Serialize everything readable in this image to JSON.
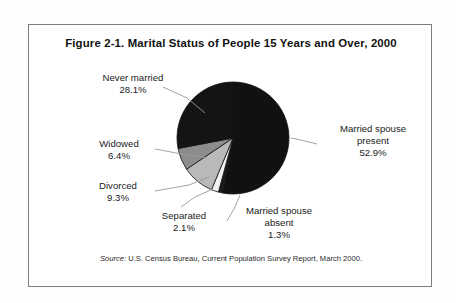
{
  "figure": {
    "title": "Figure 2-1. Marital Status of People 15 Years and Over, 2000",
    "source_prefix": "Source:",
    "source_text": " U.S. Census Bureau, Current Population Survey Report, March 2000."
  },
  "labels": {
    "never_married": {
      "name": "Never married",
      "pct": "28.1%"
    },
    "widowed": {
      "name": "Widowed",
      "pct": "6.4%"
    },
    "divorced": {
      "name": "Divorced",
      "pct": "9.3%"
    },
    "separated": {
      "name": "Separated",
      "pct": "2.1%"
    },
    "married_absent": {
      "name": "Married spouse",
      "name2": "absent",
      "pct": "1.3%"
    },
    "married_present": {
      "name": "Married spouse",
      "name2": "present",
      "pct": "52.9%"
    }
  },
  "colors": {
    "married_present": "#111111",
    "married_absent": "#1c1c1c",
    "separated": "#f2f2f2",
    "divorced": "#b9b9b9",
    "widowed": "#8c8c8c",
    "never_married": "#141414",
    "outline": "#111111",
    "frame": "#7d7d7d",
    "leader": "#9a9a9a",
    "background": "#ffffff"
  },
  "chart_data": {
    "type": "pie",
    "title": "Figure 2-1. Marital Status of People 15 Years and Over, 2000",
    "xlabel": "",
    "ylabel": "",
    "units": "percent",
    "legend_position": "callout-labels",
    "grid": false,
    "start_angle_deg": 0,
    "direction": "clockwise",
    "categories": [
      "Married spouse present",
      "Married spouse absent",
      "Separated",
      "Divorced",
      "Widowed",
      "Never married"
    ],
    "values": [
      52.9,
      1.3,
      2.1,
      9.3,
      6.4,
      28.1
    ],
    "value_labels": [
      "52.9%",
      "1.3%",
      "2.1%",
      "9.3%",
      "6.4%",
      "28.1%"
    ],
    "total": 100.1,
    "slices": [
      {
        "label": "Married spouse present",
        "value": 52.9,
        "color": "#111111",
        "start_deg": 0.0,
        "end_deg": 190.4
      },
      {
        "label": "Married spouse absent",
        "value": 1.3,
        "color": "#1c1c1c",
        "start_deg": 190.4,
        "end_deg": 195.1
      },
      {
        "label": "Separated",
        "value": 2.1,
        "color": "#f2f2f2",
        "start_deg": 195.1,
        "end_deg": 202.6
      },
      {
        "label": "Divorced",
        "value": 9.3,
        "color": "#b9b9b9",
        "start_deg": 202.6,
        "end_deg": 236.1
      },
      {
        "label": "Widowed",
        "value": 6.4,
        "color": "#8c8c8c",
        "start_deg": 236.1,
        "end_deg": 259.2
      },
      {
        "label": "Never married",
        "value": 28.1,
        "color": "#141414",
        "start_deg": 259.2,
        "end_deg": 360.0
      }
    ],
    "annotation": "Source: U.S. Census Bureau, Current Population Survey Report, March 2000."
  }
}
